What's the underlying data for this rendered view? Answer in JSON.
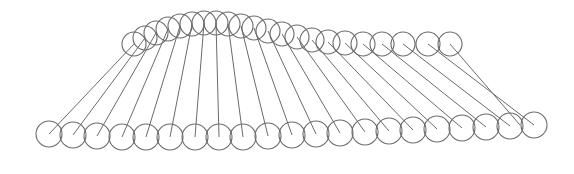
{
  "drawing": {
    "description": "Line drawing of circles along an upper arc connected by straight lines to a lower row of circles",
    "stroke_color": "#6b6b6b",
    "background": "#ffffff",
    "top_radius": 12,
    "bottom_radius": 13,
    "top_circles": [
      [
        134,
        44
      ],
      [
        145,
        38
      ],
      [
        156,
        33
      ],
      [
        168,
        29
      ],
      [
        180,
        26
      ],
      [
        192,
        24
      ],
      [
        204,
        23
      ],
      [
        216,
        23
      ],
      [
        228,
        24
      ],
      [
        241,
        26
      ],
      [
        254,
        28
      ],
      [
        268,
        31
      ],
      [
        282,
        34
      ],
      [
        297,
        37
      ],
      [
        312,
        40
      ],
      [
        328,
        42
      ],
      [
        345,
        43
      ],
      [
        363,
        44
      ],
      [
        382,
        44
      ],
      [
        403,
        44
      ],
      [
        428,
        44
      ],
      [
        450,
        44
      ]
    ],
    "bottom_circles": [
      [
        49,
        134
      ],
      [
        73,
        135
      ],
      [
        97,
        136
      ],
      [
        122,
        137
      ],
      [
        146,
        137
      ],
      [
        170,
        137
      ],
      [
        195,
        137
      ],
      [
        219,
        137
      ],
      [
        243,
        137
      ],
      [
        268,
        136
      ],
      [
        292,
        135
      ],
      [
        316,
        134
      ],
      [
        340,
        133
      ],
      [
        365,
        132
      ],
      [
        389,
        131
      ],
      [
        413,
        130
      ],
      [
        437,
        129
      ],
      [
        462,
        128
      ],
      [
        486,
        127
      ],
      [
        510,
        126
      ],
      [
        534,
        125
      ],
      [
        520,
        125
      ]
    ]
  }
}
